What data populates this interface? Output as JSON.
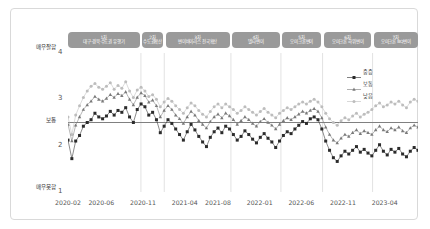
{
  "chart_data": {
    "type": "line",
    "title": "",
    "xlabel": "",
    "ylabel": "",
    "ylim": [
      1,
      4
    ],
    "grid": false,
    "legend_position": "top-right",
    "y_axis": {
      "ticks": [
        1,
        2,
        3,
        4
      ],
      "tick_labels": [
        "1",
        "2",
        "3",
        "4"
      ],
      "top_label": "매우잘함",
      "middle_label": "보통",
      "bottom_label": "매우못함",
      "reference_line_value": 2.5
    },
    "x_axis": {
      "tick_labels": [
        "2020-02",
        "2020-06",
        "2020-11",
        "2021-04",
        "2021-08",
        "2022-01",
        "2022-06",
        "2022-11",
        "2023-04"
      ],
      "tick_positions": [
        0,
        4,
        9,
        14,
        18,
        23,
        28,
        33,
        38
      ]
    },
    "waves": [
      {
        "num": "1차",
        "name": "대구·경북·수도권 유행기",
        "start": 0.0,
        "end": 8.6
      },
      {
        "num": "2차",
        "name": "수도권확산",
        "start": 8.9,
        "end": 11.4
      },
      {
        "num": "3차",
        "name": "변이바이러스 전국확산",
        "start": 11.7,
        "end": 19.4
      },
      {
        "num": "4차",
        "name": "델타변이",
        "start": 19.7,
        "end": 25.4
      },
      {
        "num": "5차",
        "name": "오미크론변이",
        "start": 25.7,
        "end": 30.4
      },
      {
        "num": "6차",
        "name": "오미크론 하위변이",
        "start": 30.7,
        "end": 36.4
      },
      {
        "num": "7차",
        "name": "오미크론 BQ변이",
        "start": 36.7,
        "end": 42.0
      }
    ],
    "series": [
      {
        "name": "중증",
        "marker": "square",
        "color": "#2b2b2b",
        "values": [
          2.12,
          1.72,
          2.1,
          2.22,
          2.42,
          2.5,
          2.56,
          2.7,
          2.62,
          2.58,
          2.64,
          2.74,
          2.66,
          2.76,
          2.72,
          2.82,
          2.62,
          2.5,
          2.78,
          2.9,
          2.84,
          2.66,
          2.72,
          2.56,
          2.28,
          2.42,
          2.56,
          2.48,
          2.36,
          2.24,
          2.12,
          2.3,
          2.46,
          2.34,
          2.2,
          2.08,
          1.98,
          2.18,
          2.3,
          2.38,
          2.28,
          2.42,
          2.36,
          2.24,
          2.12,
          2.2,
          2.32,
          2.24,
          2.14,
          2.06,
          2.18,
          2.26,
          2.16,
          2.08,
          1.96,
          2.1,
          2.22,
          2.3,
          2.26,
          2.36,
          2.44,
          2.52,
          2.48,
          2.58,
          2.62,
          2.56,
          2.36,
          2.1,
          1.9,
          1.74,
          1.66,
          1.78,
          1.88,
          1.82,
          1.9,
          1.98,
          1.86,
          1.92,
          1.84,
          1.78,
          1.9,
          2.02,
          1.88,
          1.8,
          1.92,
          1.86,
          1.94,
          1.82,
          1.76,
          1.88,
          1.96,
          1.9
        ]
      },
      {
        "name": "보통",
        "marker": "triangle",
        "color": "#7a7a7a",
        "values": [
          2.46,
          2.1,
          2.44,
          2.62,
          2.78,
          2.88,
          2.96,
          3.06,
          3.0,
          2.96,
          3.02,
          3.1,
          3.04,
          3.12,
          3.08,
          3.16,
          3.0,
          2.88,
          3.04,
          3.14,
          3.08,
          2.94,
          2.98,
          2.86,
          2.62,
          2.76,
          2.86,
          2.78,
          2.66,
          2.58,
          2.48,
          2.62,
          2.74,
          2.66,
          2.54,
          2.46,
          2.38,
          2.52,
          2.62,
          2.68,
          2.6,
          2.7,
          2.64,
          2.56,
          2.46,
          2.54,
          2.62,
          2.56,
          2.48,
          2.42,
          2.52,
          2.58,
          2.5,
          2.44,
          2.36,
          2.46,
          2.54,
          2.6,
          2.56,
          2.62,
          2.68,
          2.74,
          2.7,
          2.76,
          2.8,
          2.74,
          2.6,
          2.4,
          2.24,
          2.12,
          2.06,
          2.16,
          2.24,
          2.2,
          2.28,
          2.34,
          2.26,
          2.32,
          2.28,
          2.24,
          2.34,
          2.42,
          2.34,
          2.3,
          2.38,
          2.34,
          2.4,
          2.32,
          2.28,
          2.38,
          2.44,
          2.4
        ]
      },
      {
        "name": "낮음",
        "marker": "circle",
        "color": "#bdbdbd",
        "values": [
          2.62,
          2.24,
          2.66,
          2.86,
          3.04,
          3.18,
          3.28,
          3.34,
          3.26,
          3.22,
          3.28,
          3.36,
          3.22,
          3.3,
          3.24,
          3.38,
          3.18,
          3.04,
          3.2,
          3.26,
          3.18,
          3.06,
          3.1,
          3.0,
          2.84,
          2.94,
          3.02,
          2.96,
          2.86,
          2.78,
          2.7,
          2.82,
          2.92,
          2.86,
          2.76,
          2.68,
          2.62,
          2.74,
          2.84,
          2.9,
          2.82,
          2.9,
          2.84,
          2.78,
          2.7,
          2.76,
          2.84,
          2.78,
          2.72,
          2.66,
          2.74,
          2.8,
          2.72,
          2.66,
          2.6,
          2.7,
          2.76,
          2.82,
          2.78,
          2.84,
          2.9,
          2.94,
          2.9,
          2.96,
          3.0,
          2.94,
          2.84,
          2.7,
          2.58,
          2.5,
          2.44,
          2.54,
          2.6,
          2.56,
          2.64,
          2.7,
          2.62,
          2.68,
          2.72,
          2.78,
          2.86,
          2.92,
          2.84,
          2.88,
          2.94,
          2.9,
          2.96,
          2.88,
          2.82,
          2.94,
          3.0,
          2.96
        ]
      }
    ]
  },
  "legend": {
    "items": [
      {
        "label": "중증",
        "marker": "square"
      },
      {
        "label": "보통",
        "marker": "triangle"
      },
      {
        "label": "낮음",
        "marker": "circle"
      }
    ]
  },
  "colors": {
    "series_dark": "#2b2b2b",
    "series_mid": "#7a7a7a",
    "series_light": "#bdbdbd",
    "wave_bar": "#9a9a9a",
    "reference_line": "#808080",
    "divider_line": "#e2e2e2",
    "card_border": "#d9d9d9"
  }
}
